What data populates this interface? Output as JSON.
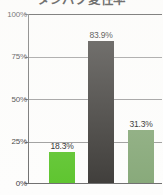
{
  "chart_data": {
    "type": "bar",
    "title": "タンパク変性率",
    "xlabel": "",
    "ylabel": "",
    "categories": [
      "",
      "",
      ""
    ],
    "values": [
      18.3,
      83.9,
      31.3
    ],
    "value_labels": [
      "18.3%",
      "83.9%",
      "31.3%"
    ],
    "bar_colors": [
      "#5cc42c",
      "#3d3b38",
      "#86a878"
    ],
    "ylim": [
      0,
      100
    ],
    "ytick_values": [
      0,
      25,
      50,
      75,
      100
    ],
    "ytick_labels": [
      "0%",
      "25%",
      "50%",
      "75%",
      "100%"
    ],
    "grid": true,
    "legend": "none",
    "value_labels_shown": true
  },
  "axis": {
    "tick_0": "0%",
    "tick_25": "25%",
    "tick_50": "50%",
    "tick_75": "75%",
    "tick_100": "100%"
  },
  "bars": {
    "bar_1_label": "18.3%",
    "bar_2_label": "83.9%",
    "bar_3_label": "31.3%"
  }
}
